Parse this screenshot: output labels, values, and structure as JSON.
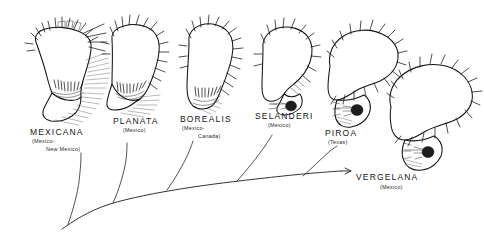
{
  "figure": {
    "background_color": "#ffffff",
    "ink_color": "#141414",
    "type": "phylogenetic-tree-with-specimen-illustrations",
    "orientation": "horizontal-trunk-rising-left-to-right"
  },
  "taxa": [
    {
      "id": "mexicana",
      "name": "MEXICANA",
      "range_lines": [
        "(Mexico-",
        "New Mexico)"
      ],
      "name_x": 30,
      "name_y": 135,
      "range_x": 32,
      "range_y": 143,
      "range_x2": 46,
      "range_y2": 151,
      "specimen_shape": "broad-angular-lobe-with-dense-setal-fringe"
    },
    {
      "id": "planata",
      "name": "PLANATA",
      "range_lines": [
        "(Mexico)"
      ],
      "name_x": 113,
      "name_y": 124,
      "range_x": 123,
      "range_y": 132,
      "specimen_shape": "tall-rounded-lobe-with-marginal-spines"
    },
    {
      "id": "borealis",
      "name": "BOREALIS",
      "range_lines": [
        "(Mexico-",
        "Canada)"
      ],
      "name_x": 180,
      "name_y": 122,
      "range_x": 182,
      "range_y": 130,
      "range_x2": 198,
      "range_y2": 138,
      "specimen_shape": "narrow-elongate-lobe-with-apical-spines"
    },
    {
      "id": "selanderi",
      "name": "SELANDERI",
      "range_lines": [
        "(Mexico)"
      ],
      "name_x": 255,
      "name_y": 119,
      "range_x": 268,
      "range_y": 127,
      "specimen_shape": "smooth-rounded-lobe-with-sparse-setae"
    },
    {
      "id": "piroa",
      "name": "PIROA",
      "range_lines": [
        "(Texas)"
      ],
      "name_x": 325,
      "name_y": 136,
      "range_x": 328,
      "range_y": 144,
      "specimen_shape": "recurved-hooked-lobe-with-dark-patch"
    },
    {
      "id": "vergelana",
      "name": "VERGELANA",
      "range_lines": [
        "(Mexico)"
      ],
      "name_x": 356,
      "name_y": 180,
      "range_x": 380,
      "range_y": 189,
      "specimen_shape": "strongly-recurved-claw-with-dark-patch"
    }
  ],
  "tree": {
    "trunk_description": "single curved trunk ascending from lower-left to right, terminating in a short arrow at VERGELANA",
    "trunk_start": [
      62,
      229
    ],
    "trunk_end": [
      345,
      171
    ],
    "branch_count": 5,
    "branch_targets": [
      "mexicana",
      "planata",
      "borealis",
      "selanderi",
      "piroa"
    ]
  }
}
